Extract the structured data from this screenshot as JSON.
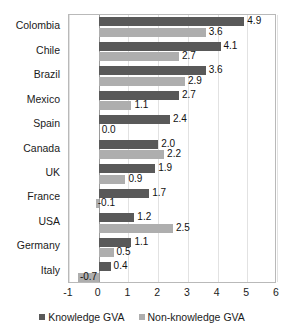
{
  "chart_data": {
    "type": "bar",
    "orientation": "horizontal",
    "title": "",
    "xlabel": "",
    "ylabel": "",
    "xlim": [
      -1,
      6
    ],
    "xticks": [
      "-1",
      "0",
      "1",
      "2",
      "3",
      "4",
      "5",
      "6"
    ],
    "grid": true,
    "legend_position": "bottom",
    "categories": [
      "Colombia",
      "Chile",
      "Brazil",
      "Mexico",
      "Spain",
      "Canada",
      "UK",
      "France",
      "USA",
      "Germany",
      "Italy"
    ],
    "series": [
      {
        "name": "Knowledge GVA",
        "color": "#595959",
        "values": [
          4.9,
          4.1,
          3.6,
          2.7,
          2.4,
          2.0,
          1.9,
          1.7,
          1.2,
          1.1,
          0.4
        ],
        "labels": [
          "4.9",
          "4.1",
          "3.6",
          "2.7",
          "2.4",
          "2.0",
          "1.9",
          "1.7",
          "1.2",
          "1.1",
          "0.4"
        ]
      },
      {
        "name": "Non-knowledge GVA",
        "color": "#aeaeae",
        "values": [
          3.6,
          2.7,
          2.9,
          1.1,
          0.0,
          2.2,
          0.9,
          -0.1,
          2.5,
          0.5,
          -0.7
        ],
        "labels": [
          "3.6",
          "2.7",
          "2.9",
          "1.1",
          "0.0",
          "2.2",
          "0.9",
          "-0.1",
          "2.5",
          "0.5",
          "-0.7"
        ]
      }
    ]
  },
  "legend": {
    "items": [
      {
        "label": "Knowledge GVA"
      },
      {
        "label": "Non-knowledge GVA"
      }
    ]
  }
}
